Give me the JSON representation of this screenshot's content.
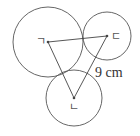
{
  "diagram": {
    "stroke_color": "#555555",
    "circles": [
      {
        "name": "circle-giyeok",
        "label": "ㄱ",
        "cx": 48,
        "cy": 42,
        "r": 35
      },
      {
        "name": "circle-digeut",
        "label": "ㄷ",
        "cx": 107,
        "cy": 36,
        "r": 24
      },
      {
        "name": "circle-nieun",
        "label": "ㄴ",
        "cx": 74,
        "cy": 98,
        "r": 28
      }
    ],
    "points": {
      "giyeok": {
        "label": "ㄱ",
        "x": 48,
        "y": 42
      },
      "digeut": {
        "label": "ㄷ",
        "x": 107,
        "y": 36
      },
      "nieun": {
        "label": "ㄴ",
        "x": 74,
        "y": 98
      }
    },
    "measurement": {
      "label": "9 cm",
      "segment": "ㄴ-ㄷ"
    }
  }
}
